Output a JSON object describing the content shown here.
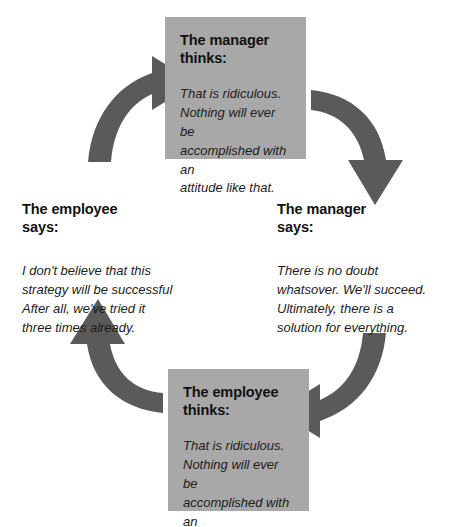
{
  "diagram": {
    "type": "cycle",
    "direction": "clockwise",
    "colors": {
      "box_fill": "#a8a8a8",
      "arrow_fill": "#5a5a5a",
      "text": "#1a1a1a",
      "background": "#ffffff"
    },
    "nodes": [
      {
        "id": "manager-thinks",
        "position": "top",
        "style": "boxed",
        "heading": "The manager\nthinks:",
        "body": "That is ridiculous.\nNothing will ever be\naccomplished with an\nattitude like that."
      },
      {
        "id": "manager-says",
        "position": "right",
        "style": "plain",
        "heading": "The manager\nsays:",
        "body": "There is no doubt\nwhatsover. We'll succeed.\nUltimately, there is a\nsolution for everything."
      },
      {
        "id": "employee-thinks",
        "position": "bottom",
        "style": "boxed",
        "heading": "The employee\nthinks:",
        "body": "That is ridiculous.\nNothing will ever be\naccomplished with an\nattitude like that."
      },
      {
        "id": "employee-says",
        "position": "left",
        "style": "plain",
        "heading": "The employee\nsays:",
        "body": "I don't believe that this\nstrategy will be successful\nAfter all, we've tried it\nthree times already."
      }
    ],
    "arrows": [
      {
        "id": "arrow-left-to-top",
        "from": "employee-says",
        "to": "manager-thinks",
        "points": "up-right"
      },
      {
        "id": "arrow-top-to-right",
        "from": "manager-thinks",
        "to": "manager-says",
        "points": "down"
      },
      {
        "id": "arrow-right-to-bottom",
        "from": "manager-says",
        "to": "employee-thinks",
        "points": "left"
      },
      {
        "id": "arrow-bottom-to-left",
        "from": "employee-thinks",
        "to": "employee-says",
        "points": "up"
      }
    ]
  }
}
